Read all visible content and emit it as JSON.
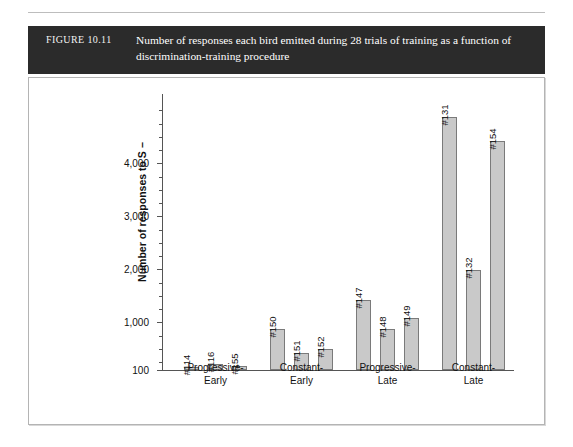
{
  "caption": {
    "figure_label": "FIGURE 10.11",
    "text": "Number of responses each bird emitted during 28 trials of training as a function of discrimination-training procedure"
  },
  "chart_data": {
    "type": "bar",
    "title": "Number of responses each bird emitted during 28 trials of training as a function of discrimination-training procedure",
    "xlabel": "",
    "ylabel": "Number of responses to S −",
    "ylim": [
      100,
      5000
    ],
    "ytick_labels": [
      "100",
      "1,000",
      "2,000",
      "3,000",
      "4,000"
    ],
    "ytick_values": [
      100,
      1000,
      2000,
      3000,
      4000
    ],
    "grid": false,
    "legend": "none",
    "categories": [
      "Progressive-\nEarly",
      "Constant-\nEarly",
      "Progressive-\nLate",
      "Constant-\nLate"
    ],
    "category_lines": [
      [
        "Progressive-",
        "Early"
      ],
      [
        "Constant-",
        "Early"
      ],
      [
        "Progressive-",
        "Late"
      ],
      [
        "Constant-",
        "Late"
      ]
    ],
    "bar_color": "#c9c9c9",
    "bar_edge_color": "#7a7a7a",
    "groups": [
      {
        "name": "Progressive-Early",
        "bars": [
          {
            "label": "#114",
            "value": 160
          },
          {
            "label": "#116",
            "value": 210
          },
          {
            "label": "#155",
            "value": 180
          }
        ]
      },
      {
        "name": "Constant-Early",
        "bars": [
          {
            "label": "#150",
            "value": 870
          },
          {
            "label": "#151",
            "value": 420
          },
          {
            "label": "#152",
            "value": 500
          }
        ]
      },
      {
        "name": "Progressive-Late",
        "bars": [
          {
            "label": "#147",
            "value": 1430
          },
          {
            "label": "#148",
            "value": 870
          },
          {
            "label": "#149",
            "value": 1080
          }
        ]
      },
      {
        "name": "Constant-Late",
        "bars": [
          {
            "label": "#131",
            "value": 4880
          },
          {
            "label": "#132",
            "value": 1990
          },
          {
            "label": "#154",
            "value": 4430
          }
        ]
      }
    ]
  }
}
